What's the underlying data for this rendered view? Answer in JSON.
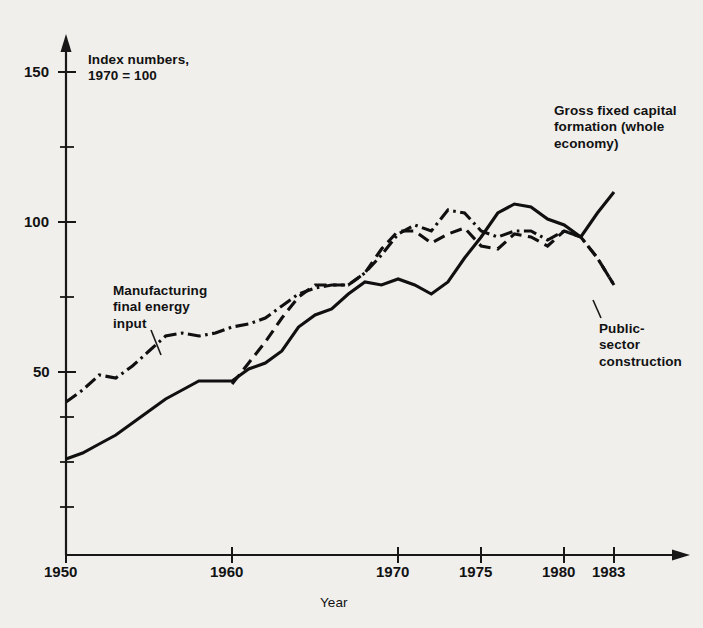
{
  "annotations": {
    "index_note": "Index numbers,\n1970 = 100",
    "gfcf_label": "Gross fixed capital\nformation (whole\neconomy)",
    "manufacturing_label": "Manufacturing\nfinal energy\ninput",
    "public_label": "Public-\nsector\nconstruction"
  },
  "axes": {
    "x_title": "Year",
    "x_tick_labels": [
      "1950",
      "1960",
      "1970",
      "1975",
      "1980",
      "1983"
    ],
    "y_tick_labels": [
      "150",
      "100",
      "50"
    ]
  },
  "chart_data": {
    "type": "line",
    "title": "",
    "subtitle": "Index numbers, 1970 = 100",
    "xlabel": "Year",
    "ylabel": "",
    "xlim": [
      1950,
      1983
    ],
    "ylim": [
      0,
      155
    ],
    "grid": false,
    "legend": "inline annotations",
    "x_ticks": [
      1950,
      1960,
      1970,
      1975,
      1980,
      1983
    ],
    "y_ticks": [
      50,
      100,
      150
    ],
    "y_minor_ticks": [
      12.5,
      25,
      37.5,
      75,
      125
    ],
    "series": [
      {
        "name": "Gross fixed capital formation (whole economy)",
        "style": "solid",
        "x": [
          1950,
          1951,
          1952,
          1953,
          1954,
          1955,
          1956,
          1957,
          1958,
          1959,
          1960,
          1961,
          1962,
          1963,
          1964,
          1965,
          1966,
          1967,
          1968,
          1969,
          1970,
          1971,
          1972,
          1973,
          1974,
          1975,
          1976,
          1977,
          1978,
          1979,
          1980,
          1981,
          1982,
          1983
        ],
        "values": [
          21,
          23,
          26,
          29,
          33,
          37,
          41,
          44,
          47,
          47,
          47,
          51,
          53,
          57,
          65,
          69,
          71,
          76,
          80,
          79,
          81,
          79,
          76,
          80,
          88,
          95,
          103,
          106,
          105,
          101,
          99,
          95,
          103,
          110
        ]
      },
      {
        "name": "Manufacturing final energy input",
        "style": "dash-dot",
        "x": [
          1950,
          1951,
          1952,
          1953,
          1954,
          1955,
          1956,
          1957,
          1958,
          1959,
          1960,
          1961,
          1962,
          1963,
          1964,
          1965,
          1966,
          1967,
          1968,
          1969,
          1970,
          1971,
          1972,
          1973,
          1974,
          1975,
          1976,
          1977,
          1978,
          1979,
          1980,
          1981,
          1982,
          1983
        ],
        "values": [
          40,
          44,
          49,
          48,
          52,
          57,
          62,
          63,
          62,
          63,
          65,
          66,
          68,
          72,
          76,
          78,
          79,
          79,
          83,
          89,
          96,
          99,
          97,
          104,
          103,
          97,
          95,
          97,
          97,
          94,
          97,
          95,
          88,
          79
        ]
      },
      {
        "name": "Public-sector construction",
        "style": "dashed",
        "x": [
          1960,
          1961,
          1962,
          1963,
          1964,
          1965,
          1966,
          1967,
          1968,
          1969,
          1970,
          1971,
          1972,
          1973,
          1974,
          1975,
          1976,
          1977,
          1978,
          1979,
          1980,
          1981,
          1982,
          1983
        ],
        "values": [
          46,
          53,
          60,
          68,
          75,
          79,
          79,
          79,
          83,
          91,
          97,
          97,
          93,
          96,
          98,
          92,
          91,
          96,
          95,
          92,
          97,
          95,
          88,
          79
        ]
      }
    ]
  }
}
